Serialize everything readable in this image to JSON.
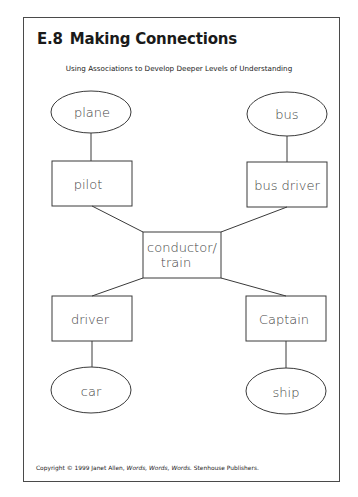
{
  "header": {
    "number": "E.8",
    "title": "Making Connections",
    "subtitle": "Using Associations to Develop Deeper Levels of Understanding"
  },
  "diagram": {
    "center": {
      "label_line1": "conductor/",
      "label_line2": "train"
    },
    "branches": [
      {
        "position": "top-left",
        "role": "pilot",
        "vehicle": "plane"
      },
      {
        "position": "top-right",
        "role": "bus driver",
        "vehicle": "bus"
      },
      {
        "position": "bottom-left",
        "role": "driver",
        "vehicle": "car"
      },
      {
        "position": "bottom-right",
        "role": "Captain",
        "vehicle": "ship"
      }
    ],
    "colors": {
      "stroke": "#3a3a3a",
      "text": "#444444"
    }
  },
  "footer": {
    "copyright_prefix": "Copyright © 1999 Janet Allen, ",
    "book_title": "Words, Words, Words.",
    "publisher": " Stenhouse Publishers."
  }
}
